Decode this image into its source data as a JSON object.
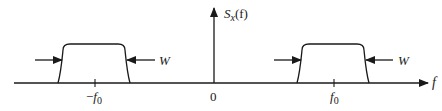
{
  "figure": {
    "type": "power spectral density diagram",
    "y_axis_label": {
      "main": "S",
      "sub": "x",
      "arg": "(f)"
    },
    "x_axis_label": "f",
    "origin_label": "0",
    "ticks": [
      {
        "label_prefix": "−",
        "label_main": "f",
        "label_sub": "0",
        "position": "-f0"
      },
      {
        "label_prefix": "",
        "label_main": "f",
        "label_sub": "0",
        "position": "f0"
      }
    ],
    "bands": [
      {
        "center": "-f0",
        "width_label": "W"
      },
      {
        "center": "f0",
        "width_label": "W"
      }
    ],
    "colors": {
      "stroke": "#1a1a1a",
      "background": "#ffffff"
    }
  }
}
